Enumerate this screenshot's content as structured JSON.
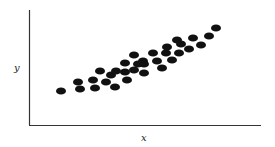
{
  "chart_data": {
    "type": "scatter",
    "title": "",
    "xlabel": "x",
    "ylabel": "y",
    "grid": false,
    "legend": null,
    "x_ticks": [],
    "y_ticks": [],
    "note": "Positive linear correlation; coordinates in pixel space (x right, y up from axis origin at (29,125))",
    "points": [
      [
        32,
        34
      ],
      [
        49,
        43
      ],
      [
        51,
        36
      ],
      [
        64,
        45
      ],
      [
        66,
        37
      ],
      [
        71,
        54
      ],
      [
        77,
        43
      ],
      [
        82,
        50
      ],
      [
        87,
        54
      ],
      [
        86,
        38
      ],
      [
        96,
        62
      ],
      [
        96,
        53
      ],
      [
        98,
        45
      ],
      [
        105,
        70
      ],
      [
        105,
        55
      ],
      [
        109,
        61
      ],
      [
        114,
        64
      ],
      [
        115,
        52
      ],
      [
        115,
        61
      ],
      [
        124,
        72
      ],
      [
        128,
        64
      ],
      [
        133,
        57
      ],
      [
        137,
        72
      ],
      [
        138,
        78
      ],
      [
        143,
        65
      ],
      [
        148,
        85
      ],
      [
        150,
        72
      ],
      [
        152,
        81
      ],
      [
        160,
        76
      ],
      [
        164,
        87
      ],
      [
        172,
        80
      ],
      [
        180,
        89
      ],
      [
        187,
        97
      ]
    ],
    "color": "#111111",
    "axis_color": "#333333"
  }
}
